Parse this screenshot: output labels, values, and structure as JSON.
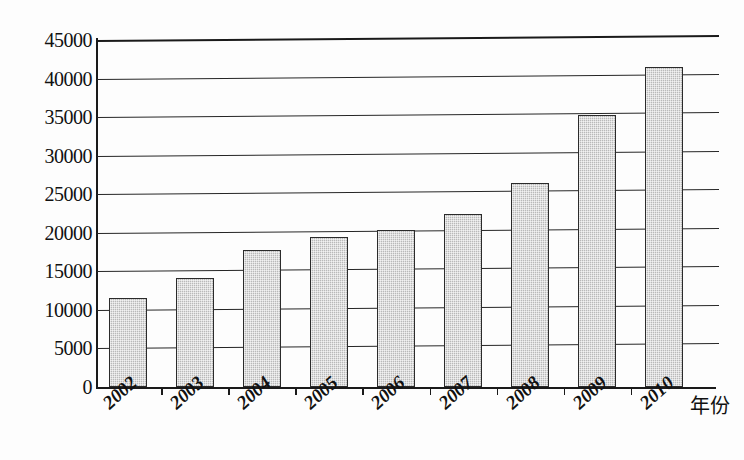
{
  "chart_data": {
    "type": "bar",
    "title": "",
    "subtitle": "",
    "xlabel": "年份",
    "ylabel": "",
    "categories": [
      "2002",
      "2003",
      "2004",
      "2005",
      "2006",
      "2007",
      "2008",
      "2009",
      "2010"
    ],
    "values": [
      11500,
      14100,
      17800,
      19400,
      20400,
      22500,
      26500,
      35300,
      41500
    ],
    "series": [
      {
        "name": "",
        "values": [
          11500,
          14100,
          17800,
          19400,
          20400,
          22500,
          26500,
          35300,
          41500
        ]
      }
    ],
    "ylim": [
      0,
      45000
    ],
    "ytick_values": [
      0,
      5000,
      10000,
      15000,
      20000,
      25000,
      30000,
      35000,
      40000,
      45000
    ],
    "ytick_labels": [
      "0",
      "5000",
      "10000",
      "15000",
      "20000",
      "25000",
      "30000",
      "35000",
      "40000",
      "45000"
    ],
    "grid": true,
    "grid_axis": "y",
    "legend": false,
    "legend_position": "none",
    "annotations": [],
    "colors": {
      "bar_fill": "#b9b9b9",
      "bar_border": "#2b2b2b",
      "gridline": "#262626",
      "axis": "#1a1a1a",
      "background": "#fdfdfd",
      "text": "#111111"
    }
  },
  "axis": {
    "x_title": "年份"
  }
}
